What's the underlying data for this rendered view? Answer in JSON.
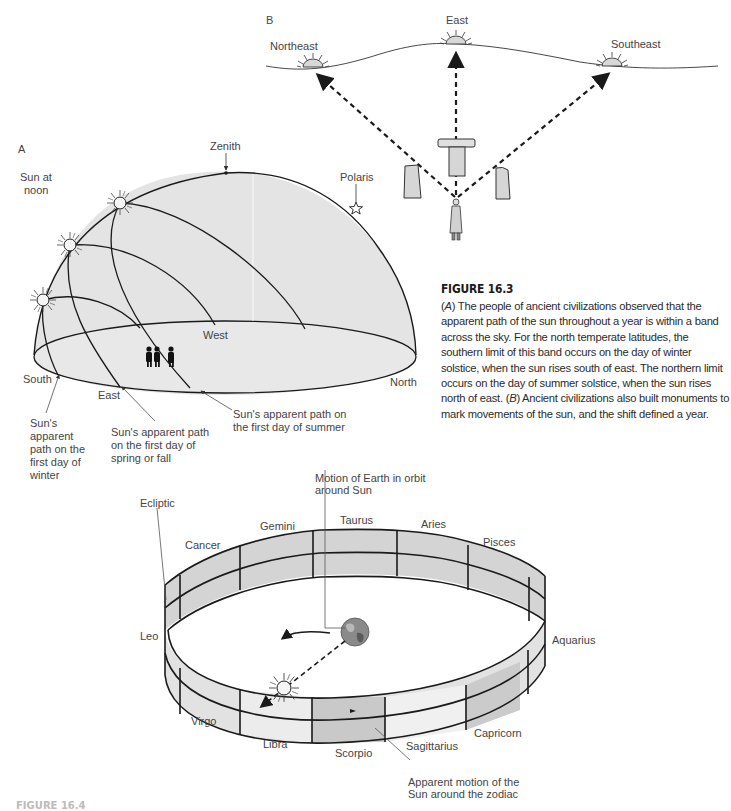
{
  "figure_a": {
    "panel_label": "A",
    "labels": {
      "zenith": "Zenith",
      "polaris": "Polaris",
      "sun_at_noon": [
        "Sun at",
        "noon"
      ],
      "west": "West",
      "south": "South",
      "east": "East",
      "north": "North",
      "winter_path": [
        "Sun's",
        "apparent",
        "path on the",
        "first day of",
        "winter"
      ],
      "spring_fall_path": [
        "Sun's apparent path",
        "on the first day of",
        "spring or fall"
      ],
      "summer_path": [
        "Sun's apparent path on",
        "the first day of summer"
      ]
    }
  },
  "figure_b": {
    "panel_label": "B",
    "labels": {
      "northeast": "Northeast",
      "east": "East",
      "southeast": "Southeast"
    }
  },
  "caption": {
    "title": "FIGURE 16.3",
    "label_a": "A",
    "text_a": " The people of ancient civilizations observed that the apparent path of the sun throughout a year is within a band across the sky. For the north temperate latitudes, the southern limit of this band occurs on the day of winter solstice, when the sun rises south of east. The northern limit occurs on the day of summer solstice, when the sun rises north of east. ",
    "label_b": "B",
    "text_b": " Ancient civilizations also built monuments to mark movements of the sun, and the shift defined a year."
  },
  "zodiac": {
    "labels": {
      "ecliptic": "Ecliptic",
      "earth_motion": [
        "Motion of Earth in orbit",
        "around Sun"
      ],
      "sun_motion": [
        "Apparent motion of the",
        "Sun around the zodiac"
      ]
    },
    "constellations": [
      "Cancer",
      "Gemini",
      "Taurus",
      "Aries",
      "Pisces",
      "Aquarius",
      "Capricorn",
      "Sagittarius",
      "Scorpio",
      "Libra",
      "Virgo",
      "Leo"
    ]
  },
  "colors": {
    "dome_fill": "#e4e4e4",
    "segment_dark": "#d2d2d2",
    "segment_light": "#ececec",
    "stroke": "#1a1a1a",
    "text": "#444444"
  },
  "next_caption_cutoff": "FIGURE 16.4"
}
